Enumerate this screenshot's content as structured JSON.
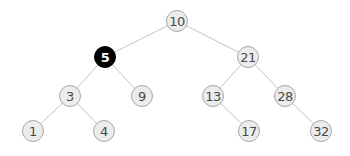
{
  "diagram": {
    "type": "binary-search-tree",
    "highlighted_node": "5",
    "colors": {
      "node_fill": "#ececec",
      "node_border": "#a8a8a8",
      "node_text": "#4a4a4a",
      "highlight_fill": "#000000",
      "highlight_text": "#ffffff",
      "edge": "#c4c4c4"
    },
    "nodes": [
      {
        "id": "n10",
        "label": "10",
        "x": 177,
        "y": 21,
        "highlight": false
      },
      {
        "id": "n5",
        "label": "5",
        "x": 105,
        "y": 57,
        "highlight": true
      },
      {
        "id": "n21",
        "label": "21",
        "x": 248,
        "y": 57,
        "highlight": false
      },
      {
        "id": "n3",
        "label": "3",
        "x": 70,
        "y": 96,
        "highlight": false
      },
      {
        "id": "n9",
        "label": "9",
        "x": 142,
        "y": 96,
        "highlight": false
      },
      {
        "id": "n13",
        "label": "13",
        "x": 213,
        "y": 96,
        "highlight": false
      },
      {
        "id": "n28",
        "label": "28",
        "x": 285,
        "y": 96,
        "highlight": false
      },
      {
        "id": "n1",
        "label": "1",
        "x": 33,
        "y": 131,
        "highlight": false
      },
      {
        "id": "n4",
        "label": "4",
        "x": 104,
        "y": 131,
        "highlight": false
      },
      {
        "id": "n17",
        "label": "17",
        "x": 249,
        "y": 131,
        "highlight": false
      },
      {
        "id": "n32",
        "label": "32",
        "x": 321,
        "y": 131,
        "highlight": false
      }
    ],
    "edges": [
      {
        "from": "n10",
        "to": "n5"
      },
      {
        "from": "n10",
        "to": "n21"
      },
      {
        "from": "n5",
        "to": "n3"
      },
      {
        "from": "n5",
        "to": "n9"
      },
      {
        "from": "n21",
        "to": "n13"
      },
      {
        "from": "n21",
        "to": "n28"
      },
      {
        "from": "n3",
        "to": "n1"
      },
      {
        "from": "n3",
        "to": "n4"
      },
      {
        "from": "n13",
        "to": "n17"
      },
      {
        "from": "n28",
        "to": "n32"
      }
    ]
  }
}
